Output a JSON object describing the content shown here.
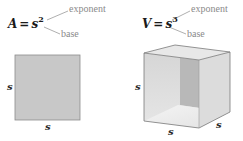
{
  "area": {
    "variable": "A",
    "equals": "=",
    "base": "s",
    "exponent": "2",
    "exponent_label": "exponent",
    "base_label": "base",
    "side_label_left": "s",
    "side_label_bottom": "s"
  },
  "volume": {
    "variable": "V",
    "equals": "=",
    "base": "s",
    "exponent": "3",
    "exponent_label": "exponent",
    "base_label": "base",
    "side_label_left": "s",
    "side_label_bottom": "s",
    "side_label_depth": "s"
  },
  "colors": {
    "square_fill": "#c8c8c8",
    "square_stroke": "#8c8c8c",
    "cube_front": "#d9d9d9",
    "cube_back_wall": "#b5b5b5",
    "cube_floor": "#f0f0f0",
    "leader_line": "#9a9a9a"
  }
}
